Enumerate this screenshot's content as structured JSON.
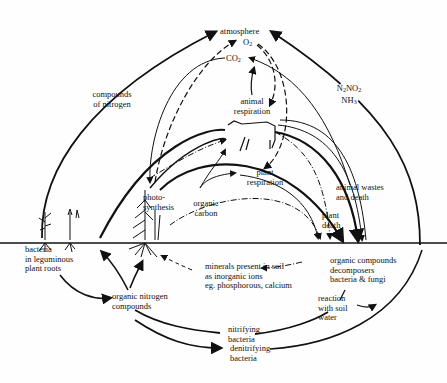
{
  "diagram": {
    "labels": {
      "atmosphere": "atmosphere",
      "o2": "O",
      "o2_sub": "2",
      "co2": "CO",
      "co2_sub": "2",
      "n_gases_line1_a": "N",
      "n_gases_line1_a_sub": "2",
      "n_gases_line1_b": "NO",
      "n_gases_line1_b_sub": "2",
      "n_gases_line2": "NH",
      "n_gases_line2_sub": "3",
      "compounds_of_nitrogen_1": "compounds",
      "compounds_of_nitrogen_2": "of nitrogen",
      "animal_respiration_1": "animal",
      "animal_respiration_2": "respiration",
      "plant_respiration_1": "plant",
      "plant_respiration_2": "respiration",
      "photosynthesis_1": "photo-",
      "photosynthesis_2": "synthesis",
      "organic_carbon_1": "organic",
      "organic_carbon_2": "carbon",
      "animal_wastes_1": "animal wastes",
      "animal_wastes_2": "and death",
      "plant_death_1": "plant",
      "plant_death_2": "death",
      "bacteria_legume_1": "bacteria",
      "bacteria_legume_2": "in leguminous",
      "bacteria_legume_3": "plant roots",
      "minerals_1": "minerals present in soil",
      "minerals_2": "as inorganic ions",
      "minerals_3": "eg. phosphorous, calcium",
      "organic_compounds_1": "organic compounds",
      "organic_compounds_2": "decomposers",
      "organic_compounds_3": "bacteria & fungi",
      "organic_nitrogen_1": "organic nitrogen",
      "organic_nitrogen_2": "compounds",
      "reaction_soil_1": "reaction",
      "reaction_soil_2": "with soil",
      "reaction_soil_3": "water",
      "nitrifying_1": "nitrifying",
      "nitrifying_2": "bacteria",
      "denitrifying_1": "denitrifying",
      "denitrifying_2": "bacteria"
    },
    "colors": {
      "ink": "#111111",
      "background": "#fefefe"
    }
  }
}
